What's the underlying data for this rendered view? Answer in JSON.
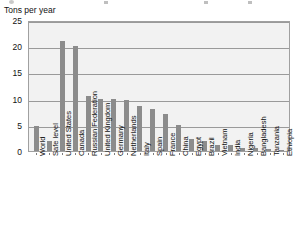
{
  "top_sliver": {
    "present": true,
    "description": "cut-off-toolbar-row"
  },
  "chart_data": {
    "type": "bar",
    "title": "",
    "subtitle": "",
    "ylabel": "Tons per year",
    "xlabel": "",
    "ylim": [
      0,
      25
    ],
    "yticks": [
      0,
      5,
      10,
      15,
      20,
      25
    ],
    "grid": true,
    "legend": false,
    "bar_color": "#8c8c8c",
    "plot_background": "#f2f2f2",
    "categories": [
      "World",
      "Safe level",
      "United States",
      "Canada",
      "Russian Federation",
      "United Kingdom",
      "Germany",
      "Netherlands",
      "Italy",
      "Spain",
      "France",
      "China",
      "Egypt",
      "Brazil",
      "Vietnam",
      "India",
      "Nigeria",
      "Bangladesh",
      "Tanzania",
      "Ethiopia"
    ],
    "values": [
      4.8,
      2.0,
      21.0,
      20.0,
      10.5,
      10.0,
      10.0,
      9.8,
      8.5,
      8.0,
      7.0,
      5.0,
      2.2,
      2.0,
      1.2,
      1.2,
      0.6,
      0.6,
      0.3,
      0.2
    ]
  }
}
